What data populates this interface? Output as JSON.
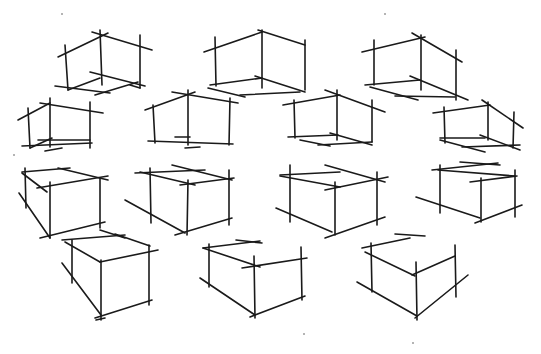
{
  "image": {
    "subject": "Hand-drawn pencil sketch of wireframe boxes in perspective",
    "medium": "pencil on white paper",
    "ink_color": "#1a1a1a",
    "background_color": "#ffffff",
    "box_count": 14,
    "rows": [
      {
        "name": "row-1",
        "box_count": 3,
        "view": "seen from below (bottom face visible)"
      },
      {
        "name": "row-2",
        "box_count": 4,
        "view": "seen from below (bottom face visible)"
      },
      {
        "name": "row-3",
        "box_count": 4,
        "view": "seen from above (top face visible)"
      },
      {
        "name": "row-4",
        "box_count": 3,
        "view": "seen from above (top face visible)"
      }
    ]
  }
}
